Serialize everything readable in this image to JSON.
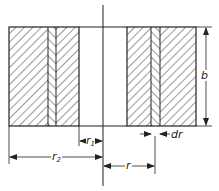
{
  "diagram": {
    "type": "cross-section",
    "colors": {
      "line": "#222222",
      "hatch": "#333333",
      "background": "#ffffff"
    },
    "labels": {
      "b": "b",
      "r1_main": "r",
      "r1_sub": "1",
      "r2_main": "r",
      "r2_sub": "2",
      "r": "r",
      "dr": "dr"
    }
  }
}
